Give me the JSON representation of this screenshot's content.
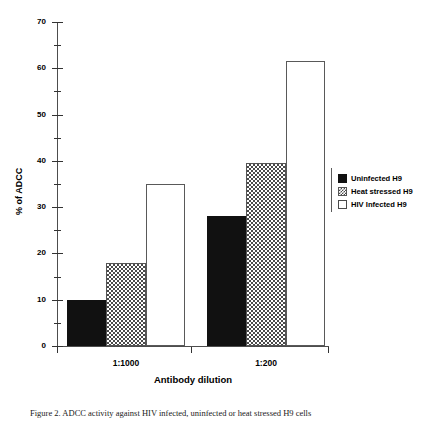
{
  "chart_data": {
    "type": "bar",
    "title": "",
    "xlabel": "Antibody dilution",
    "ylabel": "% of ADCC",
    "categories": [
      "1:1000",
      "1:200"
    ],
    "series": [
      {
        "name": "Uninfected H9",
        "style": "solid",
        "values": [
          10,
          28
        ]
      },
      {
        "name": "Heat stressed H9",
        "style": "checker",
        "values": [
          18,
          39.5
        ]
      },
      {
        "name": "HIV Infected H9",
        "style": "open",
        "values": [
          35,
          61.5
        ]
      }
    ],
    "ylim": [
      0,
      70
    ],
    "ytick_labels": [
      "0",
      "10",
      "20",
      "30",
      "40",
      "50",
      "60",
      "70"
    ],
    "ytick_values": [
      0,
      10,
      20,
      30,
      40,
      50,
      60,
      70
    ],
    "yminor_values": [
      5,
      15,
      25,
      35,
      45,
      55,
      65
    ],
    "grid": false,
    "legend_position": "right"
  },
  "legend": {
    "items": [
      {
        "label": "Uninfected H9"
      },
      {
        "label": "Heat stressed H9"
      },
      {
        "label": "HIV Infected H9"
      }
    ]
  },
  "caption": {
    "text": "Figure 2.  ADCC activity against HIV infected, uninfected or heat stressed H9 cells"
  }
}
